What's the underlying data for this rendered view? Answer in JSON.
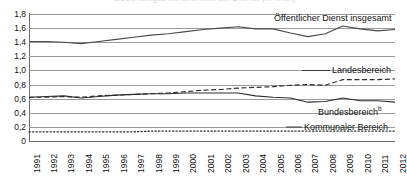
{
  "chart_title": "Beschäftigte im öffentlichen Dienst (in Mio.)",
  "chart_data": {
    "type": "line",
    "title": "Beschäftigte im öffentlichen Dienst (in Mio.)",
    "xlabel": "",
    "ylabel": "",
    "ylim": [
      0,
      1.8
    ],
    "ytick_labels": [
      "1,8",
      "1,6",
      "1,4",
      "1,2",
      "1,0",
      "0,8",
      "0,6",
      "0,4",
      "0,2",
      "0"
    ],
    "ytick_values": [
      1.8,
      1.6,
      1.4,
      1.2,
      1.0,
      0.8,
      0.6,
      0.4,
      0.2,
      0
    ],
    "grid": true,
    "legend_position": "inline-right",
    "categories": [
      "1991",
      "1992",
      "1993",
      "1994",
      "1995",
      "1996",
      "1997",
      "1998",
      "1999",
      "2000",
      "2001",
      "2002",
      "2003",
      "2004",
      "2005",
      "2006",
      "2007",
      "2008",
      "2009",
      "2010",
      "2011",
      "2012"
    ],
    "series": [
      {
        "name": "Öffentlicher Dienst insgesamt",
        "style": "solid",
        "color": "#4a4a4a",
        "values": [
          1.41,
          1.41,
          1.4,
          1.38,
          1.41,
          1.44,
          1.47,
          1.5,
          1.52,
          1.55,
          1.58,
          1.6,
          1.62,
          1.59,
          1.59,
          1.53,
          1.48,
          1.52,
          1.63,
          1.59,
          1.56,
          1.58
        ]
      },
      {
        "name": "Landesbereich",
        "style": "dashed",
        "color": "#2e2e2e",
        "values": [
          0.62,
          0.62,
          0.63,
          0.62,
          0.64,
          0.65,
          0.66,
          0.67,
          0.68,
          0.7,
          0.72,
          0.73,
          0.75,
          0.76,
          0.77,
          0.79,
          0.8,
          0.79,
          0.87,
          0.87,
          0.87,
          0.88
        ]
      },
      {
        "name": "Bundesbereich",
        "name_superscript": "b",
        "style": "solid",
        "color": "#2e2e2e",
        "values": [
          0.62,
          0.63,
          0.64,
          0.61,
          0.63,
          0.65,
          0.66,
          0.67,
          0.67,
          0.68,
          0.68,
          0.68,
          0.68,
          0.64,
          0.62,
          0.61,
          0.55,
          0.56,
          0.61,
          0.57,
          0.57,
          0.55
        ]
      },
      {
        "name": "Kommunaler Bereich",
        "style": "dotted",
        "color": "#2e2e2e",
        "values": [
          0.13,
          0.13,
          0.13,
          0.13,
          0.13,
          0.13,
          0.13,
          0.14,
          0.14,
          0.14,
          0.14,
          0.14,
          0.14,
          0.14,
          0.14,
          0.14,
          0.14,
          0.14,
          0.14,
          0.14,
          0.14,
          0.14
        ]
      }
    ]
  },
  "labels": {
    "gesamt": "Öffentlicher Dienst insgesamt",
    "landes": "Landesbereich",
    "bundes": "Bundesbereich",
    "bundes_sup": "b",
    "kommunal": "Kommunaler Bereich"
  }
}
